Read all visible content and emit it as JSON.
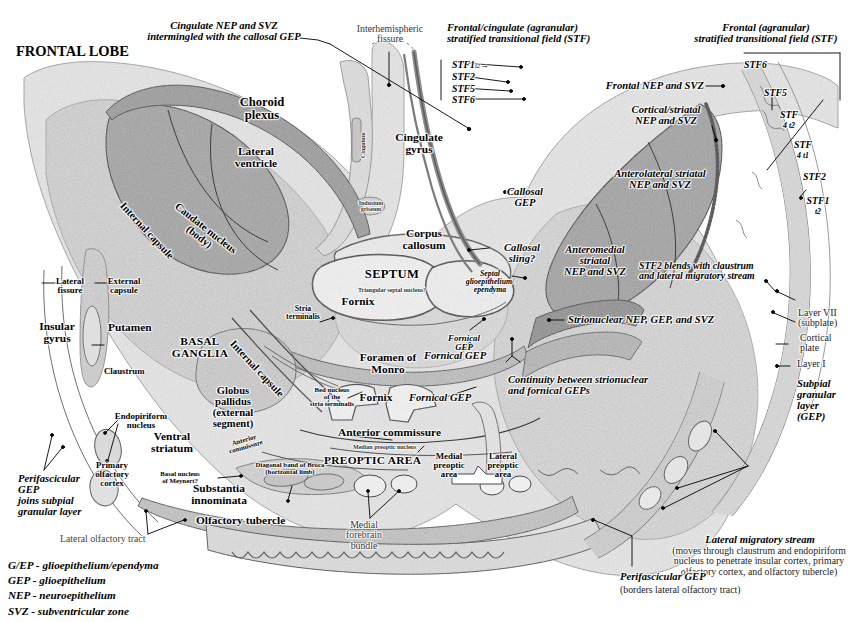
{
  "figure": {
    "colors": {
      "ink": "#000000",
      "paper": "#ffffff",
      "tissue_light": "#e4e4e4",
      "tissue_mid": "#cfcfcf",
      "tissue_dark": "#b3b3b3",
      "germinal_zone": "#a6a6a6",
      "germinal_zone_dark": "#8f8f8f",
      "outline": "#3a3a3a"
    }
  },
  "region_titles": {
    "frontal_lobe": "FRONTAL LOBE",
    "septum": "SEPTUM",
    "basal_ganglia": "BASAL\nGANGLIA",
    "preoptic_area": "PREOPTIC AREA"
  },
  "callouts": {
    "cingulate_nep_svz": "Cingulate NEP and SVZ\nintermingled with the callosal GEP",
    "interhemispheric_fissure": "Interhemispheric\nfissure",
    "frontal_cingulate_stf": "Frontal/cingulate (agranular)\nstratified transitional field (STF)",
    "frontal_stf": "Frontal (agranular)\nstratified transitional field (STF)",
    "frontal_nep_svz": "Frontal NEP and SVZ",
    "cortical_striatal_nep_svz": "Cortical/striatal\nNEP and SVZ",
    "anterolateral_striatal": "Anterolateral striatal\nNEP and SVZ",
    "anteromedial_striatal": "Anteromedial\nstriatal\nNEP and SVZ",
    "stf2_blends": "STF2 blends with claustrum\nand lateral migratory stream",
    "strionuclear": "Strionuclear NEP, GEP, and SVZ",
    "continuity": "Continuity between strionuclear\nand fornical GEPs",
    "callosal_gep": "Callosal\nGEP",
    "callosal_sling": "Callosal\nsling?",
    "septal_gep": "Septal\nglioepithelium/\nependyma",
    "fornical_gep_upper": "Fornical\nGEP",
    "fornical_gep_left": "Fornical GEP",
    "fornical_gep_center": "Fornical GEP",
    "subpial_granular": "Subpial\ngranular\nlayer\n(GEP)",
    "perifascicular_left": "Perifascicular\nGEP\njoins subpial\ngranular layer",
    "perifascicular_bottom": "Perifascicular GEP",
    "perifascicular_bottom_sub": "(borders lateral olfactory tract)",
    "lateral_migratory_stream": "Lateral migratory stream",
    "lateral_migratory_stream_sub": "(moves through claustrum and endopiriform\nnucleus to penetrate insular cortex, primary\nolfactory cortex, and olfactory tubercle)"
  },
  "structures": {
    "choroid_plexus": "Choroid\nplexus",
    "lateral_ventricle": "Lateral\nventricle",
    "caudate_nucleus": "Caudate nucleus\n(body)",
    "internal_capsule_upper": "Internal capsule",
    "internal_capsule_lower": "Internal capsule",
    "cingulate_gyrus": "Cingulate\ngyrus",
    "cingulum": "Cingulum",
    "indusium_griseum": "Indusium\ngriseum",
    "corpus_callosum": "Corpus\ncallosum",
    "fornix_septum": "Fornix",
    "fornix_lower": "Fornix",
    "triangular_septal_nucleus": "Triangular septal nucleus?",
    "foramen_of_monro": "Foramen of\nMonro",
    "lateral_fissure": "Lateral\nfissure",
    "external_capsule": "External\ncapsule",
    "insular_gyrus": "Insular\ngyrus",
    "putamen": "Putamen",
    "claustrum": "Claustrum",
    "stria_terminalis": "Stria\nterminalis",
    "bed_nucleus": "Bed nucleus\nof the\nstria terminalis",
    "globus_pallidus": "Globus\npallidus\n(external\nsegment)",
    "ventral_striatum": "Ventral\nstriatum",
    "endopiriform_nucleus": "Endopiriform\nnucleus",
    "primary_olfactory_cortex": "Primary\nolfactory\ncortex",
    "substantia_innominata": "Substantia\ninnominata",
    "basal_nucleus_meynert": "Basal nucleus\nof Meynert?",
    "anterior_commissure_small": "Anterior\ncommissure",
    "diagonal_band_broca": "Diagonal band of Broca\n(horizontal limb)",
    "anterior_commissure": "Anterior commissure",
    "olfactory_tubercle": "Olfactory tubercle",
    "lateral_olfactory_tract": "Lateral olfactory tract",
    "medial_forebrain_bundle": "Medial\nforebrain\nbundle",
    "median_preoptic_nucleus": "Median preoptic nucleus",
    "medial_preoptic_area": "Medial\npreoptic\narea",
    "lateral_preoptic_area": "Lateral\npreoptic\narea",
    "layer_vii": "Layer VII\n(subplate)",
    "cortical_plate": "Cortical\nplate",
    "layer_i": "Layer I"
  },
  "stf_left_stack": [
    {
      "label": "STF1",
      "sub": "t2",
      "arrow": "→"
    },
    {
      "label": "STF2",
      "sub": "",
      "arrow": ""
    },
    {
      "label": "STF5",
      "sub": "",
      "arrow": ""
    },
    {
      "label": "STF6",
      "sub": "",
      "arrow": ""
    }
  ],
  "stf_right_stack": [
    {
      "label": "STF6",
      "sub": ""
    },
    {
      "label": "STF5",
      "sub": ""
    },
    {
      "label": "STF",
      "sub": "4 t2"
    },
    {
      "label": "STF",
      "sub": "4 t1"
    },
    {
      "label": "STF2",
      "sub": ""
    },
    {
      "label": "STF1",
      "sub": "t2"
    }
  ],
  "legend": [
    "G/EP - glioepithelium/ependyma",
    "GEP - glioepithelium",
    "NEP - neuroepithelium",
    "SVZ - subventricular zone"
  ]
}
